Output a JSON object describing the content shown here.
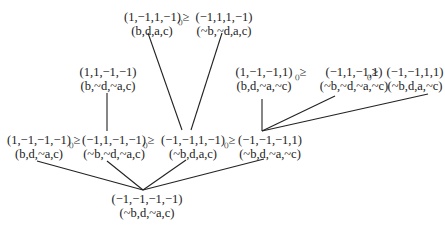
{
  "diagram": {
    "nodes": [
      {
        "id": "n_top_left",
        "vector": "(1,−1,1,−1)",
        "literals": "(b,d,a,c)"
      },
      {
        "id": "n_top_right",
        "vector": "(−1,1,1,−1)",
        "literals": "(~b,~d,a,c)"
      },
      {
        "id": "n_mid_left",
        "vector": "(1,1,−1,−1)",
        "literals": "(b,~d,~a,c)"
      },
      {
        "id": "n_r1",
        "vector": "(1,−1,−1,1)",
        "literals": "(b,d,~a,~c)"
      },
      {
        "id": "n_r2",
        "vector": "(−1,1,−1,1)",
        "literals": "(~b,~d,~a,~c)"
      },
      {
        "id": "n_r3",
        "vector": "(−1,−1,1,1)",
        "literals": "(~b,d,a,~c)"
      },
      {
        "id": "n_l1",
        "vector": "(1,−1,−1,−1)",
        "literals": "(b,d,~a,c)"
      },
      {
        "id": "n_l2",
        "vector": "(−1,1,−1,−1)",
        "literals": "(~b,~d,~a,c)"
      },
      {
        "id": "n_l3",
        "vector": "(−1,−1,1,−1)",
        "literals": "(~b,d,a,c)"
      },
      {
        "id": "n_l4",
        "vector": "(−1,−1,−1,1)",
        "literals": "(~b,d,~a,~c)"
      },
      {
        "id": "n_bottom",
        "vector": "(−1,−1,−1,−1)",
        "literals": "(~b,d,~a,c)"
      }
    ],
    "relations": [
      {
        "between": [
          "n_top_left",
          "n_top_right"
        ],
        "symbol": "≥",
        "subscript": "()"
      },
      {
        "between": [
          "n_r1",
          "n_r2"
        ],
        "symbol": "≥",
        "subscript": "()"
      },
      {
        "between": [
          "n_r2",
          "n_r3"
        ],
        "symbol": "≥",
        "subscript": "()"
      },
      {
        "between": [
          "n_l1",
          "n_l2"
        ],
        "symbol": "≥",
        "subscript": "()"
      },
      {
        "between": [
          "n_l2",
          "n_l3"
        ],
        "symbol": "≥",
        "subscript": "()"
      },
      {
        "between": [
          "n_l3",
          "n_l4"
        ],
        "symbol": "≥",
        "subscript": "()"
      }
    ],
    "edges": [
      [
        "n_top_left",
        "n_l3"
      ],
      [
        "n_top_right",
        "n_l3"
      ],
      [
        "n_mid_left",
        "n_l2"
      ],
      [
        "n_r1",
        "n_l4"
      ],
      [
        "n_r2",
        "n_l4"
      ],
      [
        "n_r3",
        "n_l4"
      ],
      [
        "n_l1",
        "n_bottom"
      ],
      [
        "n_l2",
        "n_bottom"
      ],
      [
        "n_l3",
        "n_bottom"
      ],
      [
        "n_l4",
        "n_bottom"
      ]
    ]
  }
}
